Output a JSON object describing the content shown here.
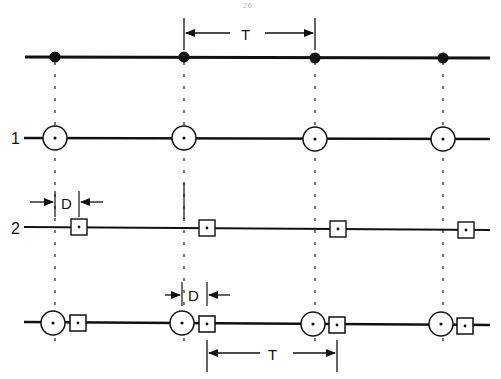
{
  "page": {
    "number": "26"
  },
  "colors": {
    "ink": "#111111",
    "background": "#ffffff"
  },
  "diagram": {
    "top_row": {
      "label": "",
      "marker": "filled-dot",
      "positions_x": [
        55,
        184,
        315,
        443
      ]
    },
    "row1": {
      "label": "1",
      "marker": "circle-with-dot",
      "positions_x": [
        55,
        184,
        315,
        443
      ]
    },
    "row2": {
      "label": "2",
      "marker": "square-with-dot",
      "positions_x": [
        79,
        207,
        338,
        466
      ]
    },
    "row3": {
      "label": "",
      "marker": "circle-and-square",
      "circle_x": [
        53,
        182,
        313,
        441
      ],
      "square_x": [
        78,
        207,
        337,
        465
      ]
    },
    "annotations": {
      "top_period": "T",
      "row2_delay": "D",
      "row3_delay": "D",
      "bottom_period": "T"
    }
  }
}
